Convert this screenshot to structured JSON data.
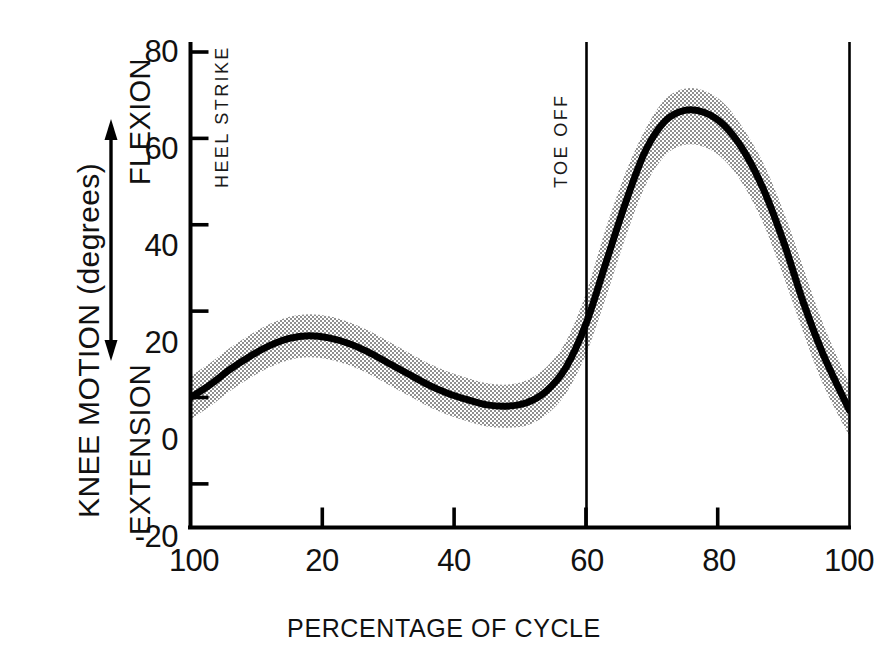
{
  "chart_data": {
    "type": "line",
    "title": "",
    "subtitle": "",
    "xlabel": "PERCENTAGE OF CYCLE",
    "ylabel": "KNEE MOTION (degrees)",
    "ylabel_direction_top": "FLEXION",
    "ylabel_direction_bottom": "EXTENSION",
    "xlim": [
      0,
      100
    ],
    "ylim": [
      -20,
      80
    ],
    "grid": false,
    "legend": "none",
    "y_ticks": [
      80,
      60,
      40,
      20,
      0,
      -20
    ],
    "y_tick_labels": [
      "80",
      "60",
      "40",
      "20",
      "0",
      "-20"
    ],
    "x_ticks": [
      0,
      20,
      40,
      60,
      80,
      100
    ],
    "x_tick_labels": [
      "100",
      "20",
      "40",
      "60",
      "80",
      "100"
    ],
    "annotations": [
      {
        "text": "HEEL STRIKE",
        "x": 0,
        "orientation": "vertical"
      },
      {
        "text": "TOE OFF",
        "x": 60,
        "orientation": "vertical"
      }
    ],
    "event_lines": [
      {
        "label": "HEEL STRIKE",
        "x": 0
      },
      {
        "label": "TOE OFF",
        "x": 60
      },
      {
        "label": "HEEL STRIKE",
        "x": 100
      }
    ],
    "series": [
      {
        "name": "Mean knee flexion",
        "x": [
          0,
          3,
          6,
          9,
          12,
          15,
          18,
          21,
          24,
          27,
          30,
          33,
          36,
          39,
          42,
          45,
          48,
          51,
          54,
          57,
          60,
          63,
          66,
          69,
          72,
          75,
          78,
          81,
          84,
          87,
          90,
          93,
          96,
          100
        ],
        "values": [
          0,
          3,
          6.5,
          9.5,
          12,
          13.7,
          14.3,
          13.8,
          12.5,
          10.5,
          8,
          5.5,
          3,
          1,
          -0.5,
          -1.7,
          -2.0,
          -1.2,
          1.5,
          7,
          17,
          31,
          45,
          57,
          64,
          66.5,
          66,
          63,
          57,
          48,
          36,
          22,
          10,
          -3
        ]
      },
      {
        "name": "Upper bound (±1 SD)",
        "x": [
          0,
          3,
          6,
          9,
          12,
          15,
          18,
          21,
          24,
          27,
          30,
          33,
          36,
          39,
          42,
          45,
          48,
          51,
          54,
          57,
          60,
          63,
          66,
          69,
          72,
          75,
          78,
          81,
          84,
          87,
          90,
          93,
          96,
          100
        ],
        "values": [
          5,
          8,
          11.5,
          14.5,
          17,
          18.7,
          19.3,
          18.8,
          17.5,
          15.5,
          13,
          10.5,
          8,
          6,
          4.5,
          3.3,
          3.0,
          4,
          7,
          13,
          24,
          39,
          52,
          62,
          69,
          71.5,
          71,
          68,
          62,
          54,
          43,
          30,
          17,
          3
        ]
      },
      {
        "name": "Lower bound (−1 SD)",
        "x": [
          0,
          3,
          6,
          9,
          12,
          15,
          18,
          21,
          24,
          27,
          30,
          33,
          36,
          39,
          42,
          45,
          48,
          51,
          54,
          57,
          60,
          63,
          66,
          69,
          72,
          75,
          78,
          81,
          84,
          87,
          90,
          93,
          96,
          100
        ],
        "values": [
          -5,
          -2,
          1.5,
          4.5,
          7,
          8.7,
          9.3,
          8.8,
          7.5,
          5.5,
          3,
          0.5,
          -2,
          -4,
          -5.5,
          -6.7,
          -7.0,
          -6.5,
          -4,
          1,
          10,
          23,
          37,
          49,
          56,
          58.5,
          58,
          55,
          49,
          40,
          28,
          15,
          3,
          -9
        ]
      }
    ],
    "band_label": "±1 standard deviation (shaded)",
    "colors": {
      "line": "#000000",
      "band": "#9a9a9a",
      "axis": "#000000",
      "text": "#111111"
    }
  },
  "axis_labels": {
    "y_title": "KNEE MOTION (degrees)",
    "flexion": "FLEXION",
    "extension": "EXTENSION",
    "x_title": "PERCENTAGE OF CYCLE",
    "y_tick_80": "80",
    "y_tick_60": "60",
    "y_tick_40": "40",
    "y_tick_20": "20",
    "y_tick_0": "0",
    "y_tick_neg20": "-20",
    "x_tick_0": "100",
    "x_tick_20": "20",
    "x_tick_40": "40",
    "x_tick_60": "60",
    "x_tick_80": "80",
    "x_tick_100": "100"
  },
  "events": {
    "heel_strike": "HEEL STRIKE",
    "toe_off": "TOE OFF"
  }
}
